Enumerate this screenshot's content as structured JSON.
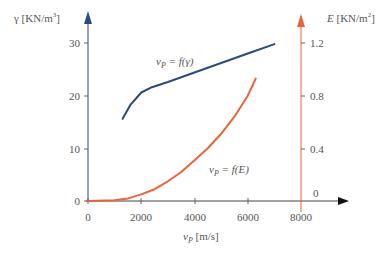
{
  "chart_data": {
    "type": "line",
    "title": "",
    "xlabel": "v_P [m/s]",
    "ylabel_left": "γ [KN/m³]",
    "ylabel_right": "E [KN/m²]",
    "xlim": [
      0,
      8000
    ],
    "ylim_left": [
      0,
      30
    ],
    "ylim_right": [
      0,
      1.2
    ],
    "x_ticks": [
      0,
      2000,
      4000,
      6000,
      8000
    ],
    "y_ticks_left": [
      0,
      10,
      20,
      30
    ],
    "y_ticks_right": [
      0,
      0.4,
      0.8,
      1.2
    ],
    "grid": false,
    "series": [
      {
        "name": "v_P = f(γ)",
        "axis": "left",
        "color": "#2b4a7e",
        "x": [
          1300,
          1600,
          2000,
          2400,
          3000,
          4000,
          5000,
          6000,
          7000
        ],
        "y": [
          15.6,
          18.3,
          20.6,
          21.6,
          22.6,
          24.4,
          26.2,
          28.0,
          29.8
        ]
      },
      {
        "name": "v_P = f(E)",
        "axis": "right",
        "color": "#e8643c",
        "x": [
          0,
          1000,
          1500,
          2000,
          2500,
          3000,
          3500,
          4000,
          4500,
          5000,
          5500,
          6000,
          6300
        ],
        "y": [
          0.0,
          0.005,
          0.02,
          0.05,
          0.09,
          0.15,
          0.22,
          0.31,
          0.4,
          0.51,
          0.64,
          0.8,
          0.93
        ]
      }
    ],
    "annotations": [
      {
        "text": "v_P = f(γ)",
        "near_series": 0
      },
      {
        "text": "v_P = f(E)",
        "near_series": 1
      }
    ]
  },
  "labels": {
    "left_axis_title": "γ [KN/m",
    "left_axis_sup": "3",
    "left_axis_close": "]",
    "right_axis_title_var": "E",
    "right_axis_title": " [KN/m",
    "right_axis_sup": "2",
    "right_axis_close": "]",
    "x_axis_var": "v",
    "x_axis_sub": "P",
    "x_axis_unit": " [m/s]",
    "series1_var": "v",
    "series1_sub": "P",
    "series1_eq": " = f(γ)",
    "series2_var": "v",
    "series2_sub": "P",
    "series2_eq": " = f(E)",
    "x_ticks": [
      "0",
      "2000",
      "4000",
      "6000",
      "8000"
    ],
    "y_left_ticks": [
      "0",
      "10",
      "20",
      "30"
    ],
    "y_right_ticks": [
      "0",
      "0.4",
      "0.8",
      "1.2"
    ]
  },
  "colors": {
    "left_axis": "#2b4a7e",
    "right_axis": "#e8643c",
    "x_axis": "#222222"
  }
}
